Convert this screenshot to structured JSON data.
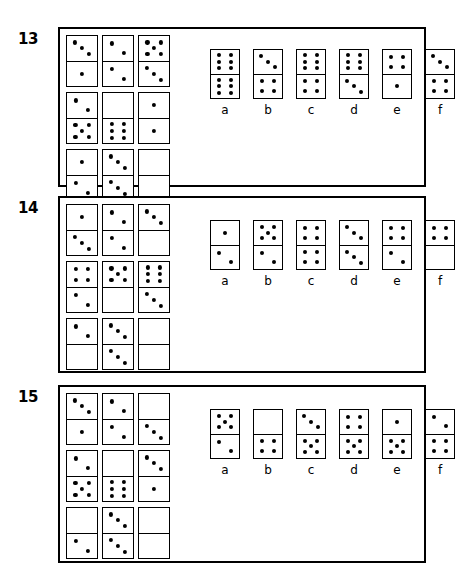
{
  "page": {
    "background": "#ffffff",
    "ink": "#000000",
    "width": 440,
    "height": 577
  },
  "puzzles": [
    {
      "number": "13",
      "grid": [
        [
          {
            "top": 3,
            "bottom": 1
          },
          {
            "top": 2,
            "bottom": 2
          },
          {
            "top": 5,
            "bottom": 3
          }
        ],
        [
          {
            "top": 2,
            "bottom": 5
          },
          {
            "top": 0,
            "bottom": 6
          },
          {
            "top": 1,
            "bottom": 1
          }
        ],
        [
          {
            "top": 1,
            "bottom": 2
          },
          {
            "top": 3,
            "bottom": 3
          },
          {
            "top": 0,
            "bottom": 0
          }
        ]
      ],
      "options": [
        {
          "label": "a",
          "top": 6,
          "bottom": 6
        },
        {
          "label": "b",
          "top": 3,
          "bottom": 4
        },
        {
          "label": "c",
          "top": 6,
          "bottom": 4
        },
        {
          "label": "d",
          "top": 6,
          "bottom": 3
        },
        {
          "label": "e",
          "top": 4,
          "bottom": 1
        },
        {
          "label": "f",
          "top": 3,
          "bottom": 4
        }
      ]
    },
    {
      "number": "14",
      "grid": [
        [
          {
            "top": 1,
            "bottom": 3
          },
          {
            "top": 2,
            "bottom": 2
          },
          {
            "top": 3,
            "bottom": 0
          }
        ],
        [
          {
            "top": 4,
            "bottom": 2
          },
          {
            "top": 5,
            "bottom": 0
          },
          {
            "top": 6,
            "bottom": 3
          }
        ],
        [
          {
            "top": 2,
            "bottom": 0
          },
          {
            "top": 3,
            "bottom": 3
          },
          {
            "top": 0,
            "bottom": 0
          }
        ]
      ],
      "options": [
        {
          "label": "a",
          "top": 1,
          "bottom": 2
        },
        {
          "label": "b",
          "top": 5,
          "bottom": 2
        },
        {
          "label": "c",
          "top": 4,
          "bottom": 4
        },
        {
          "label": "d",
          "top": 3,
          "bottom": 3
        },
        {
          "label": "e",
          "top": 4,
          "bottom": 2
        },
        {
          "label": "f",
          "top": 4,
          "bottom": 0
        }
      ]
    },
    {
      "number": "15",
      "grid": [
        [
          {
            "top": 3,
            "bottom": 1
          },
          {
            "top": 2,
            "bottom": 2
          },
          {
            "top": 0,
            "bottom": 3
          }
        ],
        [
          {
            "top": 2,
            "bottom": 5
          },
          {
            "top": 0,
            "bottom": 6
          },
          {
            "top": 3,
            "bottom": 1
          }
        ],
        [
          {
            "top": 0,
            "bottom": 2
          },
          {
            "top": 3,
            "bottom": 3
          },
          {
            "top": 0,
            "bottom": 0
          }
        ]
      ],
      "options": [
        {
          "label": "a",
          "top": 5,
          "bottom": 2
        },
        {
          "label": "b",
          "top": 0,
          "bottom": 4
        },
        {
          "label": "c",
          "top": 3,
          "bottom": 5
        },
        {
          "label": "d",
          "top": 4,
          "bottom": 5
        },
        {
          "label": "e",
          "top": 1,
          "bottom": 5
        },
        {
          "label": "f",
          "top": 2,
          "bottom": 4
        }
      ]
    }
  ]
}
